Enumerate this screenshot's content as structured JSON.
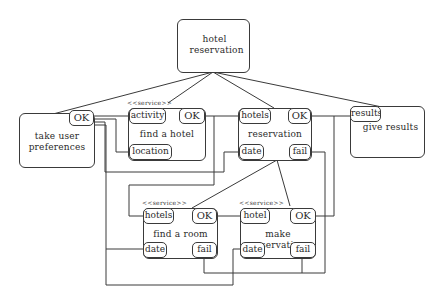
{
  "diagram": {
    "type": "service composition diagram",
    "root": {
      "id": "root",
      "label": "hotel reservation"
    },
    "stereotype": "<<service>>",
    "nodes": [
      {
        "id": "prefs",
        "label_lines": [
          "take user",
          "preferences"
        ],
        "ports": {
          "ok": "OK"
        }
      },
      {
        "id": "find_hotel",
        "label": "find a hotel",
        "stereotype": "<<service>>",
        "ports": {
          "activity": "activity",
          "ok": "OK",
          "location": "location"
        }
      },
      {
        "id": "reservation",
        "label": "reservation",
        "ports": {
          "hotels": "hotels",
          "ok": "OK",
          "date": "date",
          "fail": "fail"
        }
      },
      {
        "id": "results",
        "label": "give results",
        "ports": {
          "results": "results"
        }
      },
      {
        "id": "find_room",
        "label": "find a room",
        "stereotype": "<<service>>",
        "ports": {
          "hotels": "hotels",
          "ok": "OK",
          "date": "date",
          "fail": "fail"
        }
      },
      {
        "id": "make_res",
        "label": "make reservation",
        "stereotype": "<<service>>",
        "ports": {
          "hotel": "hotel",
          "ok": "OK",
          "date": "date",
          "fail": "fail"
        }
      }
    ],
    "edges": [
      {
        "from": "hotel reservation",
        "to": "take user preferences",
        "kind": "composition"
      },
      {
        "from": "hotel reservation",
        "to": "find a hotel",
        "kind": "composition"
      },
      {
        "from": "hotel reservation",
        "to": "reservation",
        "kind": "composition"
      },
      {
        "from": "hotel reservation",
        "to": "give results",
        "kind": "composition"
      },
      {
        "from": "reservation",
        "to": "find a room",
        "kind": "composition"
      },
      {
        "from": "reservation",
        "to": "make reservation",
        "kind": "composition"
      },
      {
        "from": "take user preferences.OK",
        "to": "find a hotel.activity"
      },
      {
        "from": "take user preferences.OK",
        "to": "find a hotel.location"
      },
      {
        "from": "take user preferences.OK",
        "to": "reservation.date"
      },
      {
        "from": "take user preferences.OK",
        "to": "find a room.date"
      },
      {
        "from": "find a hotel.OK",
        "to": "reservation.hotels"
      },
      {
        "from": "find a hotel.OK",
        "to": "find a room.hotels"
      },
      {
        "from": "reservation.OK",
        "to": "give results.results"
      },
      {
        "from": "make reservation.OK",
        "to": "give results.results"
      },
      {
        "from": "find a room.OK",
        "to": "make reservation.hotel"
      },
      {
        "from": "reservation.fail",
        "to": "make reservation.fail"
      },
      {
        "from": "find a room.fail",
        "to": "make reservation.fail"
      }
    ]
  }
}
